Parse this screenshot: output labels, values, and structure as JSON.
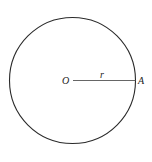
{
  "diagram": {
    "type": "circle-with-radius",
    "center_label": "O",
    "radius_label": "r",
    "point_label": "A",
    "circle": {
      "cx": 72.5,
      "cy": 80.5,
      "r": 63
    },
    "stroke_color": "#2a2a2a",
    "background": "#ffffff"
  }
}
